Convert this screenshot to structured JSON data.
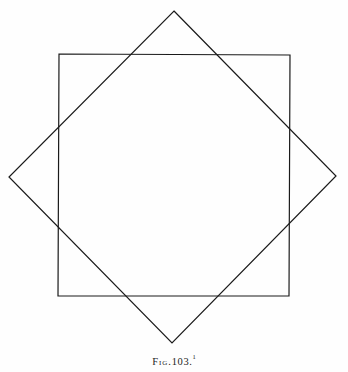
{
  "figure": {
    "caption_label": "Fig.",
    "caption_number": "103.",
    "caption_footnote_marker": "1",
    "caption_full": "Fig. 103.",
    "background_color": "#fefefe",
    "ink_color": "#1a1a1a",
    "stroke_width": 1.2
  },
  "diagram_data": {
    "type": "diagram",
    "description": "Two congruent squares superimposed, one upright and one rotated approximately 45 degrees about the same center, their edges intersecting to form an eight-pointed star outline.",
    "shapes": [
      {
        "name": "upright-square",
        "kind": "square",
        "rotation_degrees": 0,
        "vertices": [
          {
            "label": "top-left",
            "x": 59,
            "y": 54
          },
          {
            "label": "top-right",
            "x": 290,
            "y": 55
          },
          {
            "label": "bottom-right",
            "x": 289,
            "y": 296
          },
          {
            "label": "bottom-left",
            "x": 58,
            "y": 296
          }
        ]
      },
      {
        "name": "rotated-square",
        "kind": "square",
        "rotation_degrees": 45,
        "vertices": [
          {
            "label": "top",
            "x": 174,
            "y": 11
          },
          {
            "label": "right",
            "x": 336,
            "y": 176
          },
          {
            "label": "bottom",
            "x": 172,
            "y": 343
          },
          {
            "label": "left",
            "x": 9,
            "y": 177
          }
        ]
      }
    ],
    "center": {
      "x": 173,
      "y": 176
    },
    "star_points": 8
  }
}
